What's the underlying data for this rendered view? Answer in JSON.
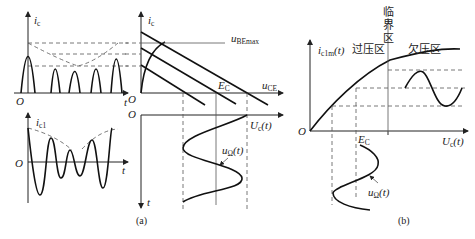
{
  "panel_a": {
    "caption": "(a)",
    "pulse_plot": {
      "y_label": "i",
      "y_sub": "c",
      "x_label": "t",
      "origin": "O"
    },
    "fundamental_plot": {
      "y_label": "i",
      "y_sub": "c1",
      "x_label": "t",
      "origin": "O"
    },
    "characteristic_plot": {
      "y_label": "i",
      "y_sub": "c",
      "x_label": "u",
      "x_sub": "CE",
      "curve_label": "u",
      "curve_sub": "BEmax",
      "supply_label": "E",
      "supply_sub": "C",
      "origin": "O"
    },
    "input_plot": {
      "x_label": "U",
      "x_sub": "c",
      "x_suffix": "(t)",
      "y_label": "t",
      "wave_label": "u",
      "wave_sub": "Ω",
      "wave_suffix": "(t)",
      "origin": "O"
    }
  },
  "panel_b": {
    "caption": "(b)",
    "y_label": "i",
    "y_sub": "c1m",
    "y_suffix": "(t)",
    "x_label": "U",
    "x_sub": "c",
    "x_suffix": "(t)",
    "origin": "O",
    "region_over": "过压区",
    "region_critical": [
      "临",
      "界",
      "区"
    ],
    "region_under": "欠压区",
    "supply_label": "E",
    "supply_sub": "C",
    "wave_label": "u",
    "wave_sub": "Ω",
    "wave_suffix": "(t)"
  }
}
